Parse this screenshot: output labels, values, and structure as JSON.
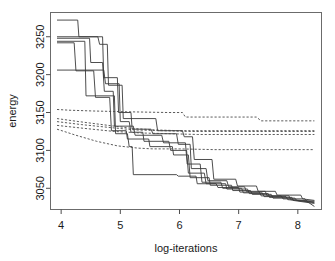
{
  "chart_data": {
    "type": "line",
    "title": "",
    "xlabel": "log-iterations",
    "ylabel": "energy",
    "xlim": [
      3.82,
      8.4
    ],
    "ylim": [
      3022,
      3282
    ],
    "xticks": [
      4,
      5,
      6,
      7,
      8
    ],
    "xtick_labels": [
      "4",
      "5",
      "6",
      "7",
      "8"
    ],
    "yticks": [
      3050,
      3100,
      3150,
      3200,
      3250
    ],
    "ytick_labels": [
      "3050",
      "3100",
      "3150",
      "3200",
      "3250"
    ],
    "grid": false,
    "legend": "none",
    "series": [
      {
        "name": "run-1-solid",
        "style": "solid",
        "x": [
          3.93,
          4.28,
          4.3,
          4.7,
          4.72,
          4.95,
          4.97,
          5.18,
          5.2,
          5.52,
          5.55,
          5.95,
          5.98,
          6.18,
          6.2,
          6.45,
          6.48,
          6.8,
          6.83,
          7.1,
          7.13,
          7.45,
          7.48,
          7.85,
          7.88,
          8.28
        ],
        "y": [
          3272,
          3272,
          3250,
          3250,
          3196,
          3196,
          3150,
          3150,
          3128,
          3128,
          3122,
          3122,
          3108,
          3108,
          3076,
          3076,
          3060,
          3060,
          3052,
          3052,
          3046,
          3046,
          3040,
          3040,
          3035,
          3033
        ]
      },
      {
        "name": "run-2-solid",
        "style": "solid",
        "x": [
          3.93,
          4.62,
          4.65,
          4.78,
          4.8,
          5.03,
          5.05,
          5.6,
          5.63,
          6.05,
          6.08,
          6.22,
          6.25,
          6.55,
          6.58,
          6.95,
          6.98,
          7.3,
          7.33,
          7.62,
          7.65,
          8.05,
          8.08,
          8.28
        ],
        "y": [
          3250,
          3250,
          3240,
          3240,
          3186,
          3186,
          3142,
          3142,
          3126,
          3126,
          3118,
          3118,
          3088,
          3088,
          3062,
          3062,
          3053,
          3053,
          3046,
          3046,
          3041,
          3041,
          3036,
          3034
        ]
      },
      {
        "name": "run-3-solid",
        "style": "solid",
        "x": [
          3.93,
          4.48,
          4.5,
          4.7,
          4.73,
          4.88,
          4.9,
          5.22,
          5.25,
          5.7,
          5.73,
          6.1,
          6.13,
          6.35,
          6.38,
          6.7,
          6.73,
          7.05,
          7.08,
          7.4,
          7.43,
          7.8,
          7.83,
          8.28
        ],
        "y": [
          3248,
          3248,
          3216,
          3216,
          3178,
          3178,
          3132,
          3132,
          3120,
          3120,
          3110,
          3110,
          3082,
          3082,
          3058,
          3058,
          3050,
          3050,
          3044,
          3044,
          3039,
          3039,
          3035,
          3032
        ]
      },
      {
        "name": "run-4-solid",
        "style": "solid",
        "x": [
          3.93,
          4.22,
          4.25,
          4.55,
          4.58,
          4.82,
          4.85,
          5.1,
          5.12,
          5.48,
          5.5,
          5.88,
          5.9,
          6.15,
          6.18,
          6.5,
          6.52,
          6.88,
          6.9,
          7.2,
          7.23,
          7.55,
          7.58,
          7.95,
          7.98,
          8.28
        ],
        "y": [
          3242,
          3242,
          3205,
          3205,
          3170,
          3170,
          3126,
          3126,
          3115,
          3115,
          3105,
          3105,
          3094,
          3094,
          3064,
          3064,
          3054,
          3054,
          3047,
          3047,
          3042,
          3042,
          3037,
          3037,
          3034,
          3031
        ]
      },
      {
        "name": "run-5-solid",
        "style": "solid",
        "x": [
          3.93,
          4.72,
          4.75,
          4.98,
          5.0,
          5.15,
          5.18,
          5.38,
          5.4,
          5.82,
          5.85,
          6.12,
          6.15,
          6.42,
          6.45,
          6.78,
          6.8,
          7.15,
          7.18,
          7.5,
          7.52,
          7.9,
          7.92,
          8.28
        ],
        "y": [
          3206,
          3206,
          3188,
          3188,
          3138,
          3138,
          3124,
          3124,
          3112,
          3112,
          3100,
          3100,
          3070,
          3070,
          3056,
          3056,
          3049,
          3049,
          3043,
          3043,
          3038,
          3038,
          3034,
          3030
        ]
      },
      {
        "name": "run-6-solid",
        "style": "solid",
        "x": [
          3.93,
          4.4,
          4.42,
          4.9,
          4.92,
          5.12,
          5.15,
          5.2,
          5.22,
          5.95,
          5.98,
          6.28,
          6.3,
          6.62,
          6.65,
          7.0,
          7.02,
          7.35,
          7.38,
          7.72,
          7.75,
          8.12,
          8.15,
          8.28
        ],
        "y": [
          3244,
          3244,
          3172,
          3172,
          3122,
          3122,
          3105,
          3105,
          3068,
          3068,
          3066,
          3066,
          3056,
          3056,
          3051,
          3051,
          3045,
          3045,
          3040,
          3040,
          3036,
          3036,
          3033,
          3026
        ]
      },
      {
        "name": "bound-1-dashed",
        "style": "dashed",
        "x": [
          3.93,
          4.15,
          4.55,
          5.1,
          5.8,
          6.05,
          6.1,
          7.3,
          7.38,
          8.28
        ],
        "y": [
          3154,
          3153,
          3152,
          3151,
          3150,
          3150,
          3144,
          3144,
          3139,
          3139
        ]
      },
      {
        "name": "bound-2-dashed",
        "style": "dashed",
        "x": [
          3.93,
          4.3,
          4.8,
          5.2,
          5.6,
          6.0,
          6.6,
          7.2,
          8.28
        ],
        "y": [
          3142,
          3138,
          3133,
          3129,
          3127,
          3126,
          3126,
          3126,
          3126
        ]
      },
      {
        "name": "bound-3-dashed",
        "style": "dashed",
        "x": [
          3.93,
          4.35,
          4.85,
          5.25,
          5.7,
          6.2,
          6.9,
          7.6,
          8.28
        ],
        "y": [
          3138,
          3134,
          3130,
          3127,
          3126,
          3125,
          3125,
          3125,
          3125
        ]
      },
      {
        "name": "bound-4-dashed",
        "style": "dashed",
        "x": [
          3.93,
          4.4,
          4.9,
          5.35,
          5.85,
          6.3,
          7.0,
          7.7,
          8.28
        ],
        "y": [
          3133,
          3129,
          3125,
          3123,
          3122,
          3121,
          3121,
          3121,
          3121
        ]
      },
      {
        "name": "bound-5-dashed",
        "style": "dashed",
        "x": [
          3.93,
          4.25,
          4.6,
          4.95,
          5.3,
          5.55,
          6.0,
          6.6,
          7.2,
          8.28
        ],
        "y": [
          3128,
          3120,
          3112,
          3106,
          3103,
          3102,
          3102,
          3101,
          3101,
          3101
        ]
      }
    ]
  },
  "axes": {
    "x_label": "log-iterations",
    "y_label": "energy"
  }
}
